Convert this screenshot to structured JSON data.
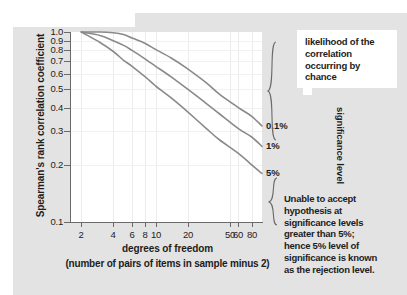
{
  "chart_data": {
    "type": "line",
    "title": "",
    "xlabel": "degrees of freedom",
    "xlabel_sub": "(number of pairs of items in sample minus 2)",
    "ylabel": "Spearman's rank correlation coefficient",
    "xscale": "log",
    "yscale": "log",
    "xlim": [
      1.6,
      100
    ],
    "ylim": [
      0.1,
      1.0
    ],
    "grid": true,
    "legend_position": "right-of-axes (curve end labels)",
    "xticks": [
      2,
      4,
      6,
      8,
      10,
      20,
      50,
      60,
      80
    ],
    "xtick_labels": [
      "2",
      "4",
      "6",
      "8",
      "10",
      "20",
      "50",
      "60",
      "80"
    ],
    "yticks": [
      0.1,
      0.2,
      0.3,
      0.4,
      0.5,
      0.6,
      0.7,
      0.8,
      0.9,
      1.0
    ],
    "ytick_labels": [
      "0.1",
      "0.2",
      "0.3",
      "0.4",
      "0.5",
      "0.6",
      "0.7",
      "0.8",
      "0.9",
      "1.0"
    ],
    "series": [
      {
        "name": "0.1%",
        "label": "0.1%",
        "color": "#8a8a8a",
        "x": [
          2,
          3,
          4,
          5,
          6,
          8,
          10,
          14,
          20,
          30,
          40,
          60,
          80,
          100
        ],
        "y": [
          1.0,
          1.0,
          0.99,
          0.97,
          0.93,
          0.87,
          0.81,
          0.73,
          0.64,
          0.54,
          0.47,
          0.4,
          0.36,
          0.32
        ]
      },
      {
        "name": "1%",
        "label": "1%",
        "color": "#8a8a8a",
        "x": [
          2,
          3,
          4,
          5,
          6,
          8,
          10,
          14,
          20,
          30,
          40,
          60,
          80,
          100
        ],
        "y": [
          1.0,
          0.96,
          0.9,
          0.85,
          0.8,
          0.72,
          0.66,
          0.58,
          0.5,
          0.42,
          0.37,
          0.31,
          0.28,
          0.25
        ]
      },
      {
        "name": "5%",
        "label": "5%",
        "color": "#8a8a8a",
        "x": [
          2,
          3,
          4,
          5,
          6,
          8,
          10,
          14,
          20,
          30,
          40,
          60,
          80,
          100
        ],
        "y": [
          1.0,
          0.88,
          0.79,
          0.71,
          0.66,
          0.58,
          0.52,
          0.45,
          0.38,
          0.31,
          0.27,
          0.23,
          0.2,
          0.18
        ]
      }
    ],
    "annotations": [
      {
        "name": "callout",
        "text": "likelihood of the correlation occurring by chance"
      },
      {
        "name": "axis-bracket-label",
        "text": "significance level"
      },
      {
        "name": "rejection-note",
        "text": "Unable to accept hypothesis at significance levels greater than 5%; hence 5% level of significance is known as the rejection level."
      }
    ]
  },
  "callout": {
    "text": "likelihood of the correlation occurring by chance"
  },
  "sig_level": {
    "text": "significance level"
  },
  "note": {
    "line1": "Unable to accept",
    "line2": "hypothesis at",
    "line3": "significance levels",
    "line4": "greater than 5%;",
    "line5": "hence 5% level of",
    "line6": "significance is known",
    "line7_plain": "as the ",
    "line7_bold": "rejection level."
  },
  "colors": {
    "figure_background": "#e3e3e3",
    "plot_background": "#ffffff",
    "axis": "#6a6a6a",
    "curve": "#8a8a8a",
    "gridline": "#ececed",
    "text": "#1d1d1d"
  }
}
